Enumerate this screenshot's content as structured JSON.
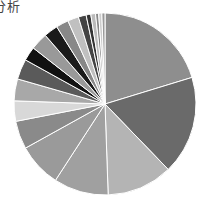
{
  "title": "分析",
  "chart_data": {
    "type": "pie",
    "title": "分析",
    "categories": [
      "S1",
      "S2",
      "S3",
      "S4",
      "S5",
      "S6",
      "S7",
      "S8",
      "S9",
      "S10",
      "S11",
      "S12",
      "S13",
      "S14",
      "S15",
      "S16",
      "S17",
      "S18",
      "S19",
      "S20"
    ],
    "values": [
      73,
      63,
      42,
      35,
      28,
      18,
      13,
      14,
      13,
      9,
      11,
      9,
      8,
      7,
      5,
      3,
      3,
      2,
      2,
      2
    ],
    "values_unit": "degrees (approx. share of 360)",
    "colors": [
      "#8e8e8e",
      "#6a6a6a",
      "#b4b4b4",
      "#a0a0a0",
      "#9a9a9a",
      "#8a8a8a",
      "#d8d8d8",
      "#a8a8a8",
      "#5a5a5a",
      "#111111",
      "#999999",
      "#1a1a1a",
      "#888888",
      "#c0c0c0",
      "#444444",
      "#333333",
      "#bbbbbb",
      "#888888",
      "#cccccc",
      "#999999"
    ],
    "start_angle": "12 o'clock, clockwise",
    "legend": "none",
    "center": [
      105,
      104
    ],
    "radius": 91
  }
}
